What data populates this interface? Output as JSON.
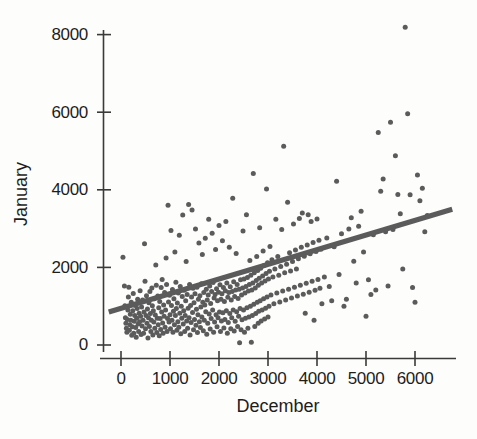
{
  "chart_data": {
    "type": "scatter",
    "title": "",
    "xlabel": "December",
    "ylabel": "January",
    "xlim": [
      -400,
      6900
    ],
    "ylim": [
      -350,
      8450
    ],
    "xticks": [
      0,
      1000,
      2000,
      3000,
      4000,
      5000,
      6000
    ],
    "xticklabels": [
      "0",
      "1000",
      "2000",
      "3000",
      "4000",
      "5000",
      "6000"
    ],
    "yticks": [
      0,
      2000,
      4000,
      6000,
      8000
    ],
    "yticklabels": [
      "0",
      "2000",
      "4000",
      "6000",
      "8000"
    ],
    "grid": false,
    "legend": null,
    "marker_color": "#5b5b5b",
    "marker_size_px": 5,
    "fit_line": {
      "label": "linear regression fit",
      "color": "#5b5b5b",
      "width_px": 5,
      "x_start": -250,
      "y_start": 850,
      "x_end": 6760,
      "y_end": 3500,
      "slope": 0.378,
      "intercept": 945
    },
    "n_points": 404,
    "points": [
      [
        40,
        2260
      ],
      [
        70,
        1520
      ],
      [
        80,
        1010
      ],
      [
        90,
        700
      ],
      [
        100,
        560
      ],
      [
        110,
        430
      ],
      [
        120,
        330
      ],
      [
        130,
        660
      ],
      [
        140,
        900
      ],
      [
        150,
        1240
      ],
      [
        160,
        1490
      ],
      [
        170,
        380
      ],
      [
        180,
        520
      ],
      [
        190,
        790
      ],
      [
        200,
        640
      ],
      [
        210,
        1100
      ],
      [
        220,
        250
      ],
      [
        230,
        470
      ],
      [
        240,
        880
      ],
      [
        250,
        1330
      ],
      [
        260,
        300
      ],
      [
        270,
        610
      ],
      [
        280,
        760
      ],
      [
        290,
        1020
      ],
      [
        300,
        450
      ],
      [
        310,
        200
      ],
      [
        320,
        690
      ],
      [
        330,
        940
      ],
      [
        340,
        1180
      ],
      [
        350,
        540
      ],
      [
        360,
        350
      ],
      [
        370,
        820
      ],
      [
        380,
        600
      ],
      [
        390,
        1400
      ],
      [
        400,
        740
      ],
      [
        410,
        270
      ],
      [
        420,
        980
      ],
      [
        430,
        490
      ],
      [
        440,
        1160
      ],
      [
        450,
        640
      ],
      [
        460,
        300
      ],
      [
        470,
        850
      ],
      [
        480,
        2610
      ],
      [
        490,
        1640
      ],
      [
        500,
        420
      ],
      [
        510,
        760
      ],
      [
        520,
        1270
      ],
      [
        530,
        560
      ],
      [
        540,
        930
      ],
      [
        550,
        180
      ],
      [
        560,
        700
      ],
      [
        570,
        1090
      ],
      [
        580,
        480
      ],
      [
        590,
        1380
      ],
      [
        600,
        810
      ],
      [
        610,
        350
      ],
      [
        620,
        640
      ],
      [
        630,
        1470
      ],
      [
        640,
        1010
      ],
      [
        650,
        260
      ],
      [
        660,
        880
      ],
      [
        670,
        590
      ],
      [
        680,
        1190
      ],
      [
        690,
        430
      ],
      [
        700,
        770
      ],
      [
        710,
        2060
      ],
      [
        720,
        1540
      ],
      [
        730,
        320
      ],
      [
        740,
        690
      ],
      [
        750,
        1260
      ],
      [
        760,
        520
      ],
      [
        770,
        960
      ],
      [
        780,
        240
      ],
      [
        790,
        1120
      ],
      [
        800,
        680
      ],
      [
        810,
        400
      ],
      [
        820,
        1480
      ],
      [
        830,
        850
      ],
      [
        840,
        1690
      ],
      [
        850,
        570
      ],
      [
        860,
        300
      ],
      [
        870,
        1030
      ],
      [
        880,
        740
      ],
      [
        890,
        1350
      ],
      [
        900,
        460
      ],
      [
        910,
        900
      ],
      [
        920,
        2240
      ],
      [
        930,
        1560
      ],
      [
        940,
        350
      ],
      [
        950,
        680
      ],
      [
        960,
        3600
      ],
      [
        970,
        1110
      ],
      [
        980,
        590
      ],
      [
        990,
        1280
      ],
      [
        1000,
        780
      ],
      [
        1010,
        420
      ],
      [
        1020,
        2950
      ],
      [
        1030,
        1020
      ],
      [
        1040,
        640
      ],
      [
        1050,
        1430
      ],
      [
        1060,
        330
      ],
      [
        1070,
        870
      ],
      [
        1080,
        1190
      ],
      [
        1090,
        520
      ],
      [
        1100,
        2400
      ],
      [
        1110,
        760
      ],
      [
        1120,
        1620
      ],
      [
        1130,
        940
      ],
      [
        1140,
        380
      ],
      [
        1150,
        1080
      ],
      [
        1160,
        600
      ],
      [
        1170,
        1340
      ],
      [
        1180,
        460
      ],
      [
        1190,
        2830
      ],
      [
        1200,
        820
      ],
      [
        1210,
        1510
      ],
      [
        1220,
        290
      ],
      [
        1230,
        1000
      ],
      [
        1240,
        690
      ],
      [
        1250,
        1250
      ],
      [
        1260,
        3350
      ],
      [
        1270,
        540
      ],
      [
        1280,
        880
      ],
      [
        1290,
        1410
      ],
      [
        1300,
        350
      ],
      [
        1310,
        760
      ],
      [
        1320,
        1140
      ],
      [
        1330,
        2150
      ],
      [
        1340,
        620
      ],
      [
        1350,
        1300
      ],
      [
        1360,
        430
      ],
      [
        1370,
        950
      ],
      [
        1380,
        3620
      ],
      [
        1390,
        700
      ],
      [
        1400,
        1560
      ],
      [
        1410,
        260
      ],
      [
        1420,
        1020
      ],
      [
        1430,
        580
      ],
      [
        1440,
        1240
      ],
      [
        1450,
        3480
      ],
      [
        1460,
        840
      ],
      [
        1470,
        1460
      ],
      [
        1480,
        390
      ],
      [
        1490,
        1090
      ],
      [
        1500,
        660
      ],
      [
        1510,
        1320
      ],
      [
        1520,
        2990
      ],
      [
        1530,
        510
      ],
      [
        1540,
        920
      ],
      [
        1550,
        1490
      ],
      [
        1560,
        320
      ],
      [
        1570,
        780
      ],
      [
        1580,
        1180
      ],
      [
        1590,
        2630
      ],
      [
        1600,
        600
      ],
      [
        1610,
        1270
      ],
      [
        1620,
        450
      ],
      [
        1630,
        980
      ],
      [
        1640,
        1580
      ],
      [
        1650,
        720
      ],
      [
        1660,
        2330
      ],
      [
        1670,
        1100
      ],
      [
        1680,
        370
      ],
      [
        1690,
        1350
      ],
      [
        1700,
        640
      ],
      [
        1710,
        1030
      ],
      [
        1720,
        2750
      ],
      [
        1730,
        860
      ],
      [
        1740,
        1440
      ],
      [
        1750,
        280
      ],
      [
        1760,
        1160
      ],
      [
        1770,
        560
      ],
      [
        1780,
        1290
      ],
      [
        1790,
        3240
      ],
      [
        1800,
        800
      ],
      [
        1810,
        1520
      ],
      [
        1820,
        410
      ],
      [
        1830,
        1070
      ],
      [
        1840,
        680
      ],
      [
        1850,
        1380
      ],
      [
        1860,
        2880
      ],
      [
        1870,
        900
      ],
      [
        1880,
        1610
      ],
      [
        1890,
        330
      ],
      [
        1900,
        1210
      ],
      [
        1910,
        590
      ],
      [
        1920,
        1300
      ],
      [
        1930,
        2460
      ],
      [
        1940,
        780
      ],
      [
        1950,
        1450
      ],
      [
        1960,
        470
      ],
      [
        1970,
        1140
      ],
      [
        1980,
        700
      ],
      [
        1990,
        1360
      ],
      [
        2000,
        3080
      ],
      [
        2010,
        850
      ],
      [
        2020,
        1550
      ],
      [
        2030,
        350
      ],
      [
        2040,
        1180
      ],
      [
        2050,
        620
      ],
      [
        2060,
        1320
      ],
      [
        2070,
        2690
      ],
      [
        2080,
        830
      ],
      [
        2090,
        1480
      ],
      [
        2100,
        440
      ],
      [
        2110,
        1120
      ],
      [
        2120,
        660
      ],
      [
        2130,
        1400
      ],
      [
        2140,
        3180
      ],
      [
        2150,
        880
      ],
      [
        2160,
        1600
      ],
      [
        2170,
        300
      ],
      [
        2180,
        1230
      ],
      [
        2190,
        580
      ],
      [
        2200,
        1350
      ],
      [
        2210,
        2520
      ],
      [
        2220,
        810
      ],
      [
        2230,
        1500
      ],
      [
        2240,
        420
      ],
      [
        2250,
        1160
      ],
      [
        2260,
        700
      ],
      [
        2270,
        1380
      ],
      [
        2280,
        3780
      ],
      [
        2290,
        900
      ],
      [
        2300,
        1630
      ],
      [
        2310,
        360
      ],
      [
        2320,
        1250
      ],
      [
        2330,
        610
      ],
      [
        2340,
        1420
      ],
      [
        2350,
        2360
      ],
      [
        2360,
        860
      ],
      [
        2370,
        1560
      ],
      [
        2380,
        480
      ],
      [
        2390,
        1200
      ],
      [
        2400,
        740
      ],
      [
        2410,
        1440
      ],
      [
        2420,
        60
      ],
      [
        2430,
        940
      ],
      [
        2440,
        1680
      ],
      [
        2450,
        390
      ],
      [
        2460,
        1290
      ],
      [
        2470,
        650
      ],
      [
        2480,
        1470
      ],
      [
        2490,
        2940
      ],
      [
        2500,
        900
      ],
      [
        2510,
        1700
      ],
      [
        2520,
        330
      ],
      [
        2530,
        1340
      ],
      [
        2540,
        690
      ],
      [
        2550,
        1510
      ],
      [
        2560,
        3360
      ],
      [
        2570,
        960
      ],
      [
        2580,
        1740
      ],
      [
        2590,
        430
      ],
      [
        2600,
        1390
      ],
      [
        2610,
        720
      ],
      [
        2620,
        1560
      ],
      [
        2630,
        2180
      ],
      [
        2640,
        1000
      ],
      [
        2650,
        1800
      ],
      [
        2660,
        70
      ],
      [
        2670,
        1420
      ],
      [
        2680,
        760
      ],
      [
        2690,
        1600
      ],
      [
        2700,
        4420
      ],
      [
        2710,
        1050
      ],
      [
        2720,
        1860
      ],
      [
        2730,
        480
      ],
      [
        2740,
        1470
      ],
      [
        2750,
        810
      ],
      [
        2760,
        1660
      ],
      [
        2770,
        2280
      ],
      [
        2780,
        1100
      ],
      [
        2790,
        1920
      ],
      [
        2800,
        560
      ],
      [
        2803,
        1540
      ],
      [
        2810,
        870
      ],
      [
        2820,
        1720
      ],
      [
        2830,
        3020
      ],
      [
        2840,
        1140
      ],
      [
        2850,
        1980
      ],
      [
        2860,
        620
      ],
      [
        2870,
        1600
      ],
      [
        2880,
        900
      ],
      [
        2890,
        1780
      ],
      [
        2900,
        2420
      ],
      [
        2910,
        1190
      ],
      [
        2920,
        2050
      ],
      [
        2930,
        670
      ],
      [
        2940,
        1650
      ],
      [
        2950,
        950
      ],
      [
        2960,
        1840
      ],
      [
        2970,
        4020
      ],
      [
        2980,
        1240
      ],
      [
        2990,
        2120
      ],
      [
        3000,
        720
      ],
      [
        3010,
        1700
      ],
      [
        3020,
        1000
      ],
      [
        3030,
        1900
      ],
      [
        3040,
        2540
      ],
      [
        3060,
        1290
      ],
      [
        3080,
        2200
      ],
      [
        3100,
        1750
      ],
      [
        3120,
        1060
      ],
      [
        3140,
        1960
      ],
      [
        3160,
        3240
      ],
      [
        3180,
        1340
      ],
      [
        3200,
        2280
      ],
      [
        3220,
        1800
      ],
      [
        3240,
        1110
      ],
      [
        3260,
        2020
      ],
      [
        3280,
        2980
      ],
      [
        3300,
        1390
      ],
      [
        3320,
        5120
      ],
      [
        3340,
        1860
      ],
      [
        3360,
        1160
      ],
      [
        3380,
        2080
      ],
      [
        3400,
        3680
      ],
      [
        3420,
        1440
      ],
      [
        3440,
        2380
      ],
      [
        3460,
        1910
      ],
      [
        3480,
        1210
      ],
      [
        3500,
        2150
      ],
      [
        3520,
        3120
      ],
      [
        3540,
        1490
      ],
      [
        3560,
        2450
      ],
      [
        3580,
        1960
      ],
      [
        3600,
        1260
      ],
      [
        3620,
        2220
      ],
      [
        3640,
        3260
      ],
      [
        3660,
        1540
      ],
      [
        3680,
        2520
      ],
      [
        3700,
        3400
      ],
      [
        3720,
        1310
      ],
      [
        3740,
        2290
      ],
      [
        3760,
        820
      ],
      [
        3780,
        1590
      ],
      [
        3800,
        2580
      ],
      [
        3820,
        3360
      ],
      [
        3840,
        1360
      ],
      [
        3860,
        2350
      ],
      [
        3880,
        3180
      ],
      [
        3900,
        1640
      ],
      [
        3920,
        2640
      ],
      [
        3940,
        640
      ],
      [
        3960,
        1410
      ],
      [
        3980,
        2410
      ],
      [
        4000,
        3250
      ],
      [
        4020,
        1690
      ],
      [
        4040,
        2700
      ],
      [
        4060,
        1460
      ],
      [
        4080,
        2470
      ],
      [
        4100,
        1060
      ],
      [
        4150,
        1750
      ],
      [
        4200,
        2760
      ],
      [
        4250,
        1510
      ],
      [
        4300,
        1140
      ],
      [
        4350,
        2530
      ],
      [
        4400,
        4220
      ],
      [
        4450,
        1820
      ],
      [
        4500,
        2870
      ],
      [
        4550,
        1000
      ],
      [
        4600,
        1180
      ],
      [
        4650,
        2990
      ],
      [
        4700,
        3280
      ],
      [
        4750,
        2160
      ],
      [
        4800,
        1600
      ],
      [
        4850,
        3060
      ],
      [
        4900,
        3450
      ],
      [
        4950,
        2400
      ],
      [
        5000,
        740
      ],
      [
        5050,
        1680
      ],
      [
        5100,
        1300
      ],
      [
        5150,
        2840
      ],
      [
        5200,
        1420
      ],
      [
        5250,
        5480
      ],
      [
        5300,
        3960
      ],
      [
        5350,
        4280
      ],
      [
        5400,
        2920
      ],
      [
        5450,
        1520
      ],
      [
        5500,
        5740
      ],
      [
        5550,
        2980
      ],
      [
        5600,
        4880
      ],
      [
        5650,
        3880
      ],
      [
        5700,
        3380
      ],
      [
        5750,
        1960
      ],
      [
        5800,
        8190
      ],
      [
        5850,
        5960
      ],
      [
        5900,
        3870
      ],
      [
        5950,
        1480
      ],
      [
        6000,
        1100
      ],
      [
        6050,
        4380
      ],
      [
        6100,
        3720
      ],
      [
        6150,
        4040
      ],
      [
        6200,
        2920
      ],
      [
        6250,
        3340
      ]
    ]
  },
  "figure": {
    "background_color": "#fdfdfc",
    "axis_color": "#3a3a38",
    "text_color": "#1d1d1b"
  }
}
